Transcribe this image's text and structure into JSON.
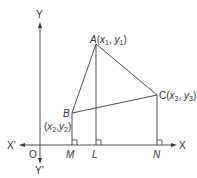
{
  "diagram": {
    "type": "coordinate-geometry-triangle",
    "axes": {
      "x_positive_label": "X",
      "x_negative_label": "X'",
      "y_positive_label": "Y",
      "y_negative_label": "Y'",
      "origin_label": "O"
    },
    "points": {
      "A": {
        "name": "A",
        "coords_label": "(x1, y1)",
        "x_sub": "1",
        "y_sub": "1"
      },
      "B": {
        "name": "B",
        "coords_label": "(x2,y2)",
        "x_sub": "2",
        "y_sub": "2"
      },
      "C": {
        "name": "C",
        "coords_label": "(x3, y3)",
        "x_sub": "3",
        "y_sub": "3"
      }
    },
    "feet": {
      "M": "M",
      "L": "L",
      "N": "N"
    },
    "text": {
      "x": "x",
      "y": "y",
      "open_paren": "(",
      "close_paren": ")",
      "comma": ", "
    },
    "color": "#3a3a3a"
  }
}
